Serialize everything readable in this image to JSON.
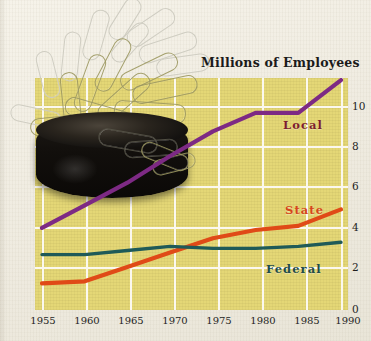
{
  "chart_data": {
    "type": "line",
    "title": "Millions of Employees",
    "subtitle": "",
    "xlabel": "",
    "ylabel": "Millions of Employees",
    "x": [
      1955,
      1960,
      1965,
      1970,
      1975,
      1980,
      1985,
      1990
    ],
    "xlim": [
      1955,
      1990
    ],
    "ylim": [
      0,
      11.2
    ],
    "yticks": [
      0,
      2,
      4,
      6,
      8,
      10
    ],
    "xticks": [
      1955,
      1960,
      1965,
      1970,
      1975,
      1980,
      1985,
      1990
    ],
    "grid": true,
    "legend_position": "inline-right-of-lines",
    "series": [
      {
        "name": "Local",
        "color": "#7d2a84",
        "label_color": "#7d1d2e",
        "values": [
          3.9,
          5.0,
          6.1,
          7.4,
          8.6,
          9.5,
          9.5,
          11.1
        ]
      },
      {
        "name": "State",
        "color": "#e04a17",
        "label_color": "#d6451b",
        "values": [
          1.2,
          1.3,
          2.0,
          2.7,
          3.4,
          3.8,
          4.0,
          4.8
        ]
      },
      {
        "name": "Federal",
        "color": "#1f5a58",
        "label_color": "#1f4c4a",
        "values": [
          2.6,
          2.6,
          2.8,
          3.0,
          2.9,
          2.9,
          3.0,
          3.2
        ]
      }
    ]
  },
  "chart": {
    "title": "Millions of Employees",
    "ytick_labels": [
      "10",
      "8",
      "6",
      "4",
      "2",
      "0"
    ],
    "xtick_labels": [
      "1955",
      "1960",
      "1965",
      "1970",
      "1975",
      "1980",
      "1985",
      "1990"
    ],
    "series_labels": {
      "local": "Local",
      "state": "State",
      "federal": "Federal"
    },
    "plot_background_color": "#e4d776",
    "gridline_color": "#fbf8ef",
    "page_background_color": "#f3f0e7"
  },
  "photo": {
    "subject": "magnetic paper clip holder with paper clips",
    "cup_color": "#120f0c",
    "clip_color": "#9c9860"
  }
}
